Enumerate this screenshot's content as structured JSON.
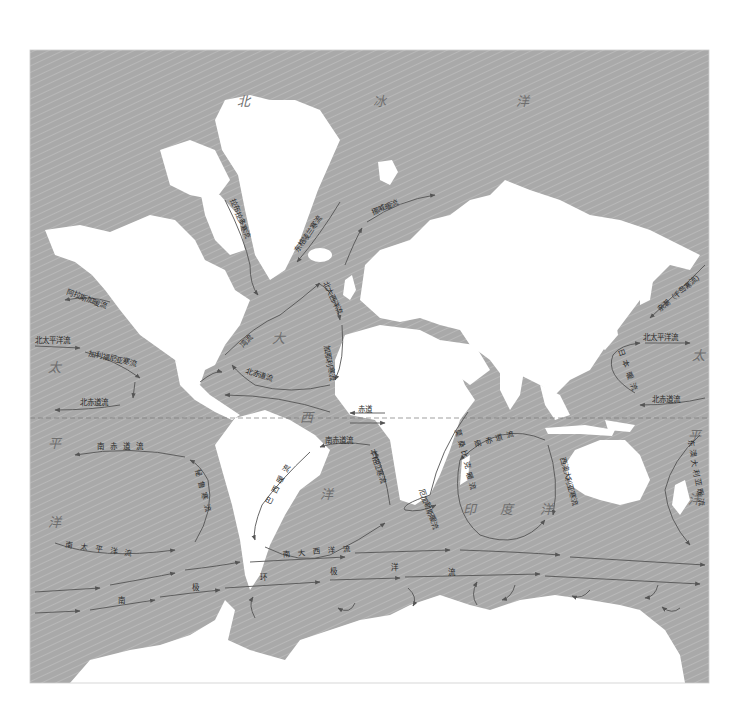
{
  "map": {
    "title": "世界洋流分布图",
    "frame": {
      "x": 30,
      "y": 50,
      "width": 679,
      "height": 633
    },
    "colors": {
      "ocean": "#a9a9a9",
      "land": "#ffffff",
      "current": "#555555",
      "label": "#2a2a2a",
      "ocean_label": "#6e6e6e"
    },
    "equator_label": "赤道",
    "ocean_labels": {
      "arctic_1": "北",
      "arctic_2": "冰",
      "arctic_3": "洋",
      "atlantic_1": "大",
      "atlantic_2": "西",
      "atlantic_3": "洋",
      "pacific_w_1": "太",
      "pacific_w_2": "平",
      "pacific_w_3": "洋",
      "pacific_e_1": "太",
      "pacific_e_2": "平",
      "pacific_e_3": "洋",
      "indian_1": "印",
      "indian_2": "度",
      "indian_3": "洋"
    },
    "currents": {
      "labrador": "拉布拉多寒流",
      "east_greenland": "东格陵兰寒流",
      "norwegian": "挪威暖流",
      "north_atlantic": "北大西洋流",
      "gulf_stream": "湾流",
      "canary": "加那利寒流",
      "n_equatorial_atl": "北赤道流",
      "alaska": "阿拉斯加暖流",
      "n_pacific_e": "北太平洋流",
      "california": "加利福尼亚寒流",
      "n_equatorial_pac_e": "北赤道流",
      "s_equatorial_pac": "南赤道流",
      "peru": "秘鲁寒流",
      "s_pacific": "南太平洋流",
      "s_equatorial_atl": "南赤道流",
      "brazil": "巴西暖流",
      "benguela": "本格拉寒流",
      "s_atlantic": "南大西洋流",
      "mozambique": "莫桑比克暖流",
      "agulhas": "厄加勒斯暖流",
      "s_equatorial_ind": "南赤道流",
      "w_australia": "西澳大利亚寒流",
      "oyashio": "亲潮（千岛寒流）",
      "n_pacific_w": "北太平洋流",
      "kuroshio": "日本暖流",
      "n_equatorial_pac_w": "北赤道流",
      "e_australia": "东澳大利亚暖流",
      "antarctic_1": "南",
      "antarctic_2": "极",
      "antarctic_3": "环",
      "antarctic_4": "极",
      "antarctic_5": "洋",
      "antarctic_6": "流"
    }
  }
}
